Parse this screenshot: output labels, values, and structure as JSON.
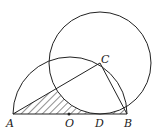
{
  "diagram": {
    "type": "geometry",
    "points": [
      {
        "name": "A",
        "label": "A",
        "x": 13,
        "y": 114,
        "lx": 6,
        "ly": 127
      },
      {
        "name": "O",
        "label": "O",
        "x": 69,
        "y": 114,
        "lx": 65,
        "ly": 127
      },
      {
        "name": "D",
        "label": "D",
        "x": 100,
        "y": 114,
        "lx": 95,
        "ly": 127
      },
      {
        "name": "B",
        "label": "B",
        "x": 127,
        "y": 114,
        "lx": 124,
        "ly": 127
      },
      {
        "name": "C",
        "label": "C",
        "x": 100,
        "y": 63,
        "lx": 101,
        "ly": 63
      }
    ],
    "stroke_color": "#222222",
    "semicircle": {
      "center": "O",
      "radius": 57
    },
    "circle": {
      "center": "C",
      "radius": 51
    },
    "segments": [
      "AB",
      "AC",
      "CB"
    ],
    "shaded_region": "region bounded by AD, arc of semicircle from A, and circle C, hatched"
  }
}
